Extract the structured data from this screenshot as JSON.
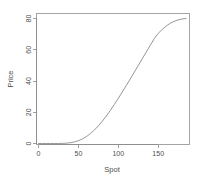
{
  "figure": {
    "background_color": "#ffffff",
    "line_color": "#8a8a8a",
    "axis_color": "#9a9a9a",
    "text_color": "#4d4d4d"
  },
  "chart_data": {
    "type": "line",
    "title": "",
    "subtitle": "",
    "xlabel": "Spot",
    "ylabel": "Price",
    "xlim": [
      0,
      193
    ],
    "ylim": [
      -1.5,
      84
    ],
    "grid": false,
    "legend": null,
    "xticks": [
      0,
      50,
      100,
      150
    ],
    "xticklabels": [
      "0",
      "50",
      "100",
      "150"
    ],
    "yticks": [
      0,
      20,
      40,
      60,
      80
    ],
    "yticklabels": [
      "0",
      "20",
      "40",
      "60",
      "80"
    ],
    "ytick_label_rotation": 90,
    "series": [
      {
        "name": "Price",
        "x": [
          0,
          5,
          10,
          15,
          20,
          25,
          30,
          35,
          40,
          45,
          50,
          55,
          60,
          65,
          70,
          75,
          80,
          85,
          90,
          95,
          100,
          105,
          110,
          115,
          120,
          125,
          130,
          135,
          140,
          145,
          150,
          155,
          160,
          165,
          170,
          175,
          180,
          185
        ],
        "y": [
          0.0,
          0.0,
          0.0,
          0.0,
          0.0,
          0.02,
          0.08,
          0.22,
          0.5,
          1.0,
          1.8,
          2.9,
          4.4,
          6.3,
          8.6,
          11.3,
          14.3,
          17.6,
          21.2,
          25.0,
          28.9,
          33.0,
          37.1,
          41.3,
          45.6,
          49.9,
          54.2,
          58.5,
          62.8,
          67.1,
          70.5,
          73.0,
          75.2,
          76.9,
          78.2,
          79.1,
          79.7,
          80.0
        ]
      }
    ]
  },
  "labels": {
    "x_axis_title": "Spot",
    "y_axis_title": "Price",
    "xtick_0": "0",
    "xtick_1": "50",
    "xtick_2": "100",
    "xtick_3": "150",
    "ytick_0": "0",
    "ytick_1": "20",
    "ytick_2": "40",
    "ytick_3": "60",
    "ytick_4": "80"
  }
}
